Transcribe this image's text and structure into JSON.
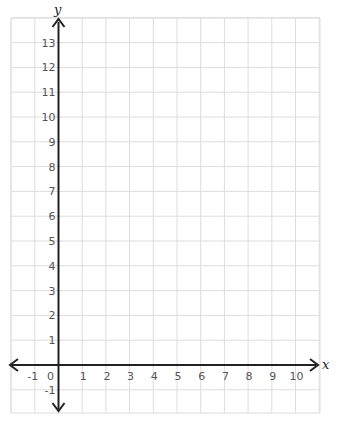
{
  "chart_data": {
    "type": "coordinate-grid",
    "title": "",
    "xlabel": "x",
    "ylabel": "y",
    "xlim": [
      -2,
      11
    ],
    "ylim": [
      -2,
      14
    ],
    "x_tick_labels": [
      "-1",
      "0",
      "1",
      "2",
      "3",
      "4",
      "5",
      "6",
      "7",
      "8",
      "9",
      "10"
    ],
    "y_tick_labels": [
      "13",
      "12",
      "11",
      "10",
      "9",
      "8",
      "7",
      "6",
      "5",
      "4",
      "3",
      "2",
      "1",
      "-1"
    ],
    "grid": true,
    "grid_spacing": 1,
    "colors": {
      "grid": "#dddddd",
      "axis": "#222222",
      "tick_text": "#555555"
    }
  }
}
